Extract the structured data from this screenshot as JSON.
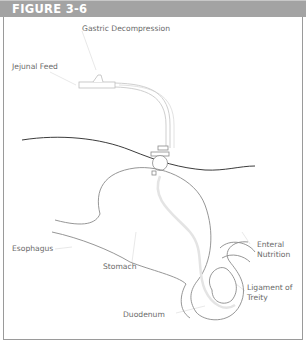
{
  "figure": {
    "title": "FIGURE 3-6",
    "colors": {
      "header_bg": "#a3a3a3",
      "header_text": "#ffffff",
      "line": "#8a8a8a",
      "skin_line": "#444444",
      "tube": "#d0d0d0",
      "label_text": "#6a6a6a"
    }
  },
  "labels": {
    "gastric_decompression": "Gastric Decompression",
    "jejunal_feed": "Jejunal Feed",
    "esophagus": "Esophagus",
    "stomach": "Stomach",
    "enteral_nutrition_line1": "Enteral",
    "enteral_nutrition_line2": "Nutrition",
    "ligament_line1": "Ligament of",
    "ligament_line2": "Treity",
    "duodenum": "Duodenum"
  }
}
